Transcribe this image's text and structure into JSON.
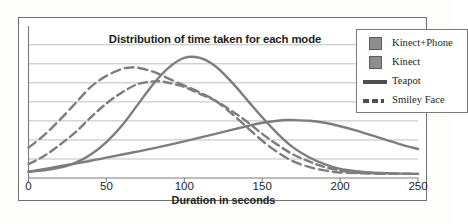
{
  "chart_data": {
    "type": "line",
    "title": "Distribution of time taken for each mode",
    "xlabel": "Duration in seconds",
    "ylabel": "",
    "xlim": [
      0,
      250
    ],
    "ylim": [
      0,
      1
    ],
    "grid": true,
    "gridlines": 7,
    "xticks": [
      "0",
      "50",
      "100",
      "150",
      "200",
      "250"
    ],
    "yticks": [],
    "legend_position": "top-right",
    "series": [
      {
        "name": "Kinect+Phone",
        "marker": "square",
        "style": "dashed",
        "color": "#7d7d7d",
        "peak_x": 85,
        "peak_y": 0.7,
        "x": [
          0,
          10,
          20,
          30,
          40,
          50,
          60,
          70,
          80,
          85,
          90,
          100,
          110,
          120,
          130,
          140,
          150,
          160,
          170,
          180,
          190,
          200,
          210,
          220,
          230,
          240,
          250
        ],
        "y": [
          0.1,
          0.16,
          0.24,
          0.33,
          0.44,
          0.54,
          0.62,
          0.68,
          0.7,
          0.7,
          0.69,
          0.66,
          0.61,
          0.56,
          0.49,
          0.41,
          0.32,
          0.24,
          0.17,
          0.12,
          0.08,
          0.055,
          0.04,
          0.035,
          0.032,
          0.03,
          0.03
        ]
      },
      {
        "name": "Kinect",
        "marker": "square",
        "style": "solid",
        "color": "#7d7d7d",
        "peak_x": 165,
        "peak_y": 0.42,
        "x": [
          0,
          20,
          40,
          60,
          80,
          100,
          120,
          140,
          150,
          160,
          165,
          170,
          180,
          190,
          200,
          210,
          220,
          230,
          240,
          250
        ],
        "y": [
          0.045,
          0.085,
          0.125,
          0.17,
          0.215,
          0.265,
          0.32,
          0.375,
          0.4,
          0.415,
          0.42,
          0.42,
          0.415,
          0.4,
          0.375,
          0.345,
          0.31,
          0.275,
          0.24,
          0.21
        ]
      },
      {
        "name": "Teapot",
        "marker": "line",
        "style": "solid",
        "color": "#7d7d7d",
        "peak_x": 100,
        "peak_y": 0.87,
        "x": [
          0,
          10,
          20,
          30,
          40,
          50,
          60,
          70,
          80,
          90,
          100,
          110,
          120,
          130,
          140,
          150,
          160,
          170,
          180,
          190,
          200,
          210,
          220,
          230,
          240,
          250
        ],
        "y": [
          0.045,
          0.055,
          0.075,
          0.11,
          0.17,
          0.26,
          0.38,
          0.53,
          0.68,
          0.8,
          0.87,
          0.87,
          0.81,
          0.7,
          0.57,
          0.44,
          0.32,
          0.22,
          0.15,
          0.1,
          0.065,
          0.05,
          0.04,
          0.035,
          0.032,
          0.03
        ]
      },
      {
        "name": "Smiley Face",
        "marker": "line",
        "style": "dashed",
        "color": "#7d7d7d",
        "peak_x": 65,
        "peak_y": 0.8,
        "x": [
          0,
          10,
          20,
          30,
          40,
          50,
          60,
          65,
          70,
          80,
          90,
          100,
          110,
          120,
          130,
          140,
          150,
          160,
          170,
          180,
          190,
          200,
          210,
          220,
          230,
          240,
          250
        ],
        "y": [
          0.22,
          0.31,
          0.42,
          0.54,
          0.66,
          0.74,
          0.79,
          0.8,
          0.8,
          0.77,
          0.72,
          0.67,
          0.62,
          0.56,
          0.47,
          0.37,
          0.27,
          0.185,
          0.12,
          0.08,
          0.055,
          0.04,
          0.035,
          0.032,
          0.03,
          0.03,
          0.03
        ]
      }
    ]
  },
  "legend": {
    "items": [
      {
        "label": "Kinect+Phone",
        "key": "square"
      },
      {
        "label": "Kinect",
        "key": "square"
      },
      {
        "label": "Teapot",
        "key": "solid-line"
      },
      {
        "label": "Smiley Face",
        "key": "dashed-line"
      }
    ]
  },
  "axis": {
    "x_title": "Duration in seconds",
    "ticks": [
      {
        "label": "0",
        "value": 0
      },
      {
        "label": "50",
        "value": 50
      },
      {
        "label": "100",
        "value": 100
      },
      {
        "label": "150",
        "value": 150
      },
      {
        "label": "200",
        "value": 200
      },
      {
        "label": "250",
        "value": 250
      }
    ]
  },
  "colors": {
    "line": "#7d7d7d",
    "grid": "#b7b7b7",
    "axis": "#7a7a7a",
    "text": "#231f20",
    "legend_swatch_fill": "#8d8d8d",
    "legend_swatch_border": "#5b5b5b"
  }
}
